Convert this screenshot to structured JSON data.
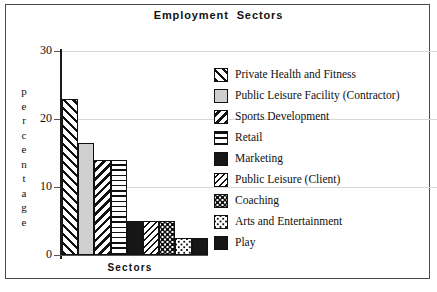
{
  "chart_data": {
    "type": "bar",
    "title": "Employment  Sectors",
    "xlabel": "Sectors",
    "ylabel": "percentage",
    "ylim": [
      0,
      30
    ],
    "yticks": [
      0,
      10,
      20,
      30
    ],
    "ytick_labels": [
      "0",
      "10",
      "20",
      "30"
    ],
    "grid": true,
    "legend_position": "right",
    "categories": [
      "Private Health and Fitness",
      "Public Leisure Facility (Contractor)",
      "Sports Development",
      "Retail",
      "Marketing",
      "Public Leisure (Client)",
      "Coaching",
      "Arts and Entertainment",
      "Play"
    ],
    "values": [
      23,
      16.5,
      14,
      14,
      5,
      5,
      5,
      2.5,
      2.5
    ],
    "patterns": [
      "diagonal-up-hatch",
      "solid-light-gray",
      "diagonal-down-hatch",
      "horizontal-lines",
      "solid-black",
      "diagonal-thin-hatch",
      "dense-dots",
      "sparse-dots",
      "solid-black"
    ]
  },
  "legend": {
    "items": [
      {
        "label": "Private Health and Fitness",
        "swatch": "diagonal-up-hatch"
      },
      {
        "label": "Public Leisure Facility (Contractor)",
        "swatch": "solid-light-gray"
      },
      {
        "label": "Sports Development",
        "swatch": "diagonal-down-hatch"
      },
      {
        "label": "Retail",
        "swatch": "horizontal-lines"
      },
      {
        "label": "Marketing",
        "swatch": "solid-black"
      },
      {
        "label": "Public Leisure (Client)",
        "swatch": "diagonal-thin-hatch"
      },
      {
        "label": "Coaching",
        "swatch": "dense-dots"
      },
      {
        "label": "Arts and Entertainment",
        "swatch": "sparse-dots"
      },
      {
        "label": "Play",
        "swatch": "solid-black"
      }
    ]
  },
  "colors": {
    "frame": "#4a4a4a",
    "axis": "#1a1a1a",
    "gridline": "#d8d8d8",
    "ink": "#111111",
    "light_gray_fill": "#cfcfcf",
    "black_fill": "#161616",
    "background": "#ffffff"
  }
}
